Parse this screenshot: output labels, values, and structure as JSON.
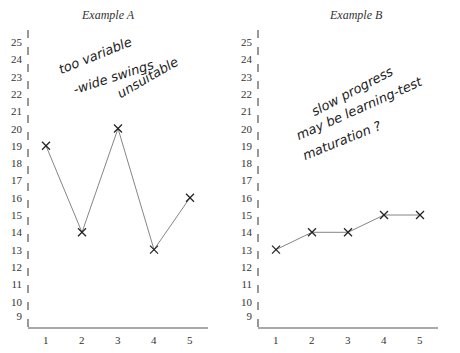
{
  "chart_data": [
    {
      "type": "line",
      "title": "Example A",
      "xlabel": "",
      "ylabel": "",
      "categories": [
        "1",
        "2",
        "3",
        "4",
        "5"
      ],
      "x": [
        1,
        2,
        3,
        4,
        5
      ],
      "values": [
        19,
        14,
        20,
        13,
        16
      ],
      "yticks": [
        9,
        10,
        11,
        12,
        13,
        14,
        15,
        16,
        17,
        18,
        19,
        20,
        21,
        22,
        23,
        24,
        25
      ],
      "ylim": [
        9,
        25
      ],
      "marker": "X",
      "grid": false,
      "annotation": [
        "too variable",
        "-wide swings",
        "unsuitable"
      ]
    },
    {
      "type": "line",
      "title": "Example B",
      "xlabel": "",
      "ylabel": "",
      "categories": [
        "1",
        "2",
        "3",
        "4",
        "5"
      ],
      "x": [
        1,
        2,
        3,
        4,
        5
      ],
      "values": [
        13,
        14,
        14,
        15,
        15
      ],
      "yticks": [
        9,
        10,
        11,
        12,
        13,
        14,
        15,
        16,
        17,
        18,
        19,
        20,
        21,
        22,
        23,
        24,
        25
      ],
      "ylim": [
        9,
        25
      ],
      "marker": "X",
      "grid": false,
      "annotation": [
        "slow progress",
        "may be learning-test",
        "maturation ?"
      ]
    }
  ],
  "panels": {
    "a": {
      "title": "Example A",
      "note": [
        "too variable",
        "-wide swings",
        "unsuitable"
      ]
    },
    "b": {
      "title": "Example B",
      "note": [
        "slow progress",
        "may be learning-test",
        "maturation ?"
      ]
    }
  }
}
